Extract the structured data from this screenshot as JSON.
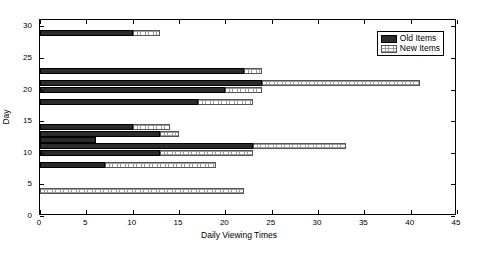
{
  "chart_data": {
    "type": "bar",
    "orientation": "horizontal",
    "stacked": true,
    "title": "",
    "xlabel": "Daily Viewing Times",
    "ylabel": "Day",
    "xlim": [
      0,
      45
    ],
    "ylim": [
      0,
      31
    ],
    "xticks": [
      0,
      5,
      10,
      15,
      20,
      25,
      30,
      35,
      40,
      45
    ],
    "yticks": [
      0,
      5,
      10,
      15,
      20,
      25,
      30
    ],
    "grid": false,
    "legend": {
      "position": "top-right",
      "entries": [
        {
          "name": "Old Items",
          "swatch": "old"
        },
        {
          "name": "New Items",
          "swatch": "new"
        }
      ]
    },
    "categories": [
      29,
      23,
      21,
      20,
      18,
      14,
      13,
      12,
      11,
      10,
      8,
      4
    ],
    "series": [
      {
        "name": "Old Items",
        "values": [
          10,
          22,
          24,
          20,
          17,
          10,
          13,
          6,
          23,
          13,
          7,
          0
        ]
      },
      {
        "name": "New Items",
        "values": [
          3,
          2,
          17,
          4,
          6,
          4,
          2,
          0,
          10,
          10,
          12,
          22
        ]
      }
    ],
    "bars": [
      {
        "day": 29,
        "old": 10,
        "new_end": 13
      },
      {
        "day": 23,
        "old": 22,
        "new_end": 24
      },
      {
        "day": 21,
        "old": 24,
        "new_end": 41
      },
      {
        "day": 20,
        "old": 20,
        "new_end": 24
      },
      {
        "day": 18,
        "old": 17,
        "new_end": 23
      },
      {
        "day": 14,
        "old": 10,
        "new_end": 14
      },
      {
        "day": 13,
        "old": 13,
        "new_end": 15
      },
      {
        "day": 12,
        "old": 6,
        "new_end": 6
      },
      {
        "day": 11,
        "old": 23,
        "new_end": 33
      },
      {
        "day": 10,
        "old": 13,
        "new_end": 23
      },
      {
        "day": 8,
        "old": 7,
        "new_end": 19
      },
      {
        "day": 4,
        "old": 0,
        "new_end": 22
      }
    ],
    "colors": {
      "old": "#2b2b2b",
      "new": "#ffffff",
      "axis": "#000000"
    }
  }
}
